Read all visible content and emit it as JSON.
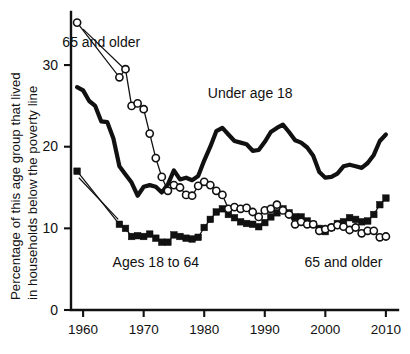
{
  "chart_data": {
    "type": "line",
    "title": "",
    "xlabel": "",
    "ylabel": "Percentage of this age group that lived in households below the poverty line",
    "ylabel_line1": "Percentage of this age group that lived",
    "ylabel_line2": "in households below the poverty line",
    "xlim": [
      1959,
      2011
    ],
    "ylim": [
      0,
      36
    ],
    "grid": false,
    "legend_position": "inline-annotations",
    "y_ticks": [
      0,
      10,
      20,
      30
    ],
    "y_tick_labels": [
      "0",
      "10",
      "20",
      "30"
    ],
    "x_ticks": [
      1960,
      1970,
      1980,
      1990,
      2000,
      2010
    ],
    "x_tick_labels": [
      "1960",
      "1970",
      "1980",
      "1990",
      "2000",
      "2010"
    ],
    "annotations": [
      {
        "name": "annotation-65-and-older-top",
        "text": "65 and older",
        "x": 1963.0,
        "y": 32.2
      },
      {
        "name": "annotation-under-age-18",
        "text": "Under age 18",
        "x": 1987.6,
        "y": 26.0
      },
      {
        "name": "annotation-ages-18-to-64",
        "text": "Ages 18 to 64",
        "x": 1972.0,
        "y": 5.3
      },
      {
        "name": "annotation-65-and-older-bottom",
        "text": "65 and older",
        "x": 2003.0,
        "y": 5.3
      }
    ],
    "series": [
      {
        "name": "Under age 18",
        "marker": "none",
        "style": "thick-solid-line",
        "color": "#111111",
        "x": [
          1959,
          1960,
          1961,
          1962,
          1963,
          1964,
          1965,
          1966,
          1967,
          1968,
          1969,
          1970,
          1971,
          1972,
          1973,
          1974,
          1975,
          1976,
          1977,
          1978,
          1979,
          1980,
          1981,
          1982,
          1983,
          1984,
          1985,
          1986,
          1987,
          1988,
          1989,
          1990,
          1991,
          1992,
          1993,
          1994,
          1995,
          1996,
          1997,
          1998,
          1999,
          2000,
          2001,
          2002,
          2003,
          2004,
          2005,
          2006,
          2007,
          2008,
          2009,
          2010
        ],
        "values": [
          27.3,
          26.9,
          25.6,
          25.0,
          23.1,
          23.0,
          21.0,
          17.6,
          16.6,
          15.6,
          14.0,
          15.1,
          15.3,
          15.1,
          14.4,
          15.4,
          17.1,
          16.0,
          16.2,
          15.9,
          16.4,
          18.3,
          20.0,
          21.9,
          22.3,
          21.5,
          20.7,
          20.5,
          20.3,
          19.5,
          19.6,
          20.6,
          21.8,
          22.3,
          22.7,
          21.8,
          20.8,
          20.5,
          19.9,
          18.9,
          16.9,
          16.2,
          16.3,
          16.7,
          17.6,
          17.8,
          17.6,
          17.4,
          18.0,
          19.0,
          20.7,
          21.5
        ]
      },
      {
        "name": "Ages 18 to 64",
        "marker": "filled-square",
        "style": "square-markers",
        "color": "#111111",
        "x": [
          1959,
          1966,
          1967,
          1968,
          1969,
          1970,
          1971,
          1972,
          1973,
          1974,
          1975,
          1976,
          1977,
          1978,
          1979,
          1980,
          1981,
          1982,
          1983,
          1984,
          1985,
          1986,
          1987,
          1988,
          1989,
          1990,
          1991,
          1992,
          1993,
          1994,
          1995,
          1996,
          1997,
          1998,
          1999,
          2000,
          2001,
          2002,
          2003,
          2004,
          2005,
          2006,
          2007,
          2008,
          2009,
          2010
        ],
        "values": [
          17.0,
          10.5,
          10.0,
          9.0,
          9.1,
          9.0,
          9.3,
          8.8,
          8.3,
          8.3,
          9.2,
          9.0,
          8.8,
          8.7,
          8.9,
          10.1,
          11.1,
          12.0,
          12.4,
          11.7,
          11.3,
          10.8,
          10.6,
          10.5,
          10.2,
          10.7,
          11.4,
          11.9,
          12.4,
          11.9,
          11.4,
          11.4,
          10.9,
          10.5,
          10.0,
          9.6,
          10.1,
          10.6,
          10.8,
          11.3,
          11.1,
          10.8,
          10.9,
          11.7,
          12.9,
          13.7
        ]
      },
      {
        "name": "65 and older",
        "marker": "open-circle",
        "style": "circle-markers",
        "color": "#111111",
        "x": [
          1959,
          1966,
          1967,
          1968,
          1969,
          1970,
          1971,
          1972,
          1973,
          1974,
          1975,
          1976,
          1977,
          1978,
          1979,
          1980,
          1981,
          1982,
          1983,
          1984,
          1985,
          1986,
          1987,
          1988,
          1989,
          1990,
          1991,
          1992,
          1993,
          1994,
          1995,
          1996,
          1997,
          1998,
          1999,
          2000,
          2001,
          2002,
          2003,
          2004,
          2005,
          2006,
          2007,
          2008,
          2009,
          2010
        ],
        "values": [
          35.2,
          28.5,
          29.5,
          25.0,
          25.3,
          24.6,
          21.6,
          18.6,
          16.3,
          14.6,
          15.3,
          15.0,
          14.1,
          14.0,
          15.2,
          15.7,
          15.3,
          14.6,
          14.1,
          12.4,
          12.6,
          12.4,
          12.5,
          12.0,
          11.4,
          12.2,
          12.4,
          12.9,
          12.2,
          11.7,
          10.5,
          10.8,
          10.5,
          10.5,
          9.7,
          9.9,
          10.1,
          10.4,
          10.2,
          9.8,
          10.1,
          9.4,
          9.7,
          9.7,
          8.9,
          9.0
        ]
      }
    ]
  },
  "plot_geometry": {
    "left": 71,
    "right": 398,
    "top": 12,
    "bottom": 310,
    "x_min": 1958.0,
    "x_max": 2012.0,
    "y_min": 0,
    "y_max": 36.5
  },
  "leaders": [
    {
      "name": "leader-65-and-older",
      "x1": 1960.0,
      "y1": 34.4,
      "x2": 1967.0,
      "y2": 29.4
    },
    {
      "name": "leader-ages-18-to-64",
      "x1": 1959.3,
      "y1": 16.2,
      "x2": 1965.8,
      "y2": 11.1
    }
  ]
}
